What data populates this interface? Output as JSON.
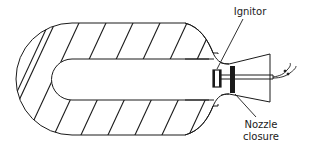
{
  "diagram": {
    "labels": {
      "ignitor": "Ignitor",
      "nozzle_closure_line1": "Nozzle",
      "nozzle_closure_line2": "closure"
    },
    "components": [
      "motor-casing",
      "propellant-grain-hatched",
      "central-bore",
      "ignitor",
      "nozzle-closure",
      "nozzle-cone",
      "ignitor-lead-wires"
    ],
    "colors": {
      "line": "#1a1a1a",
      "background": "#ffffff"
    }
  }
}
